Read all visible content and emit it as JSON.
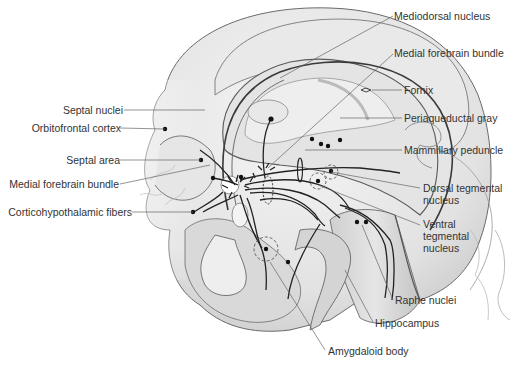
{
  "diagram": {
    "colors": {
      "tissue_light": "#ececec",
      "tissue_mid": "#d6d6d6",
      "tissue_dark": "#bdbdbd",
      "outline": "#555555",
      "pathway": "#222222",
      "leader": "#666666",
      "text": "#333333"
    },
    "labels_left": [
      {
        "id": "septal-nuclei",
        "text": "Septal nuclei"
      },
      {
        "id": "orbitofrontal-cortex",
        "text": "Orbitofrontal cortex"
      },
      {
        "id": "septal-area",
        "text": "Septal area"
      },
      {
        "id": "medial-forebrain-bundle-left",
        "text": "Medial forebrain bundle"
      },
      {
        "id": "corticohypothalamic-fibers",
        "text": "Corticohypothalamic fibers"
      }
    ],
    "labels_right": [
      {
        "id": "mediodorsal-nucleus",
        "text": "Mediodorsal nucleus"
      },
      {
        "id": "medial-forebrain-bundle-right",
        "text": "Medial forebrain bundle"
      },
      {
        "id": "fornix",
        "text": "Fornix"
      },
      {
        "id": "periaqueductal-gray",
        "text": "Periaqueductal gray"
      },
      {
        "id": "mammillary-peduncle",
        "text": "Mammillary peduncle"
      },
      {
        "id": "dorsal-tegmental-nucleus",
        "text": "Dorsal tegmental nucleus"
      },
      {
        "id": "ventral-tegmental-nucleus",
        "text": "Ventral tegmental nucleus"
      }
    ],
    "labels_bottom": [
      {
        "id": "raphe-nuclei",
        "text": "Raphe nuclei"
      },
      {
        "id": "hippocampus",
        "text": "Hippocampus"
      },
      {
        "id": "amygdaloid-body",
        "text": "Amygdaloid body"
      }
    ]
  }
}
